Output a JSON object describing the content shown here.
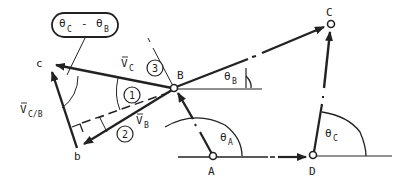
{
  "figure": {
    "type": "four-bar linkage velocity diagram",
    "colors": {
      "ink": "#222222",
      "background": "#ffffff"
    }
  },
  "points": {
    "A": "A",
    "B": "B",
    "C": "C",
    "D": "D",
    "b": "b",
    "c": "c"
  },
  "angles": {
    "theta_A": {
      "symbol": "θ",
      "sub": "A"
    },
    "theta_B": {
      "symbol": "θ",
      "sub": "B"
    },
    "theta_C": {
      "symbol": "θ",
      "sub": "C"
    },
    "difference_box": {
      "left_symbol": "θ",
      "left_sub": "C",
      "op": "-",
      "right_symbol": "θ",
      "right_sub": "B"
    }
  },
  "vectors": {
    "V_C": {
      "symbol": "V",
      "sub": "C"
    },
    "V_B": {
      "symbol": "V",
      "sub": "B"
    },
    "V_CB": {
      "symbol": "V",
      "sub": "C/B"
    }
  },
  "markers": [
    "1",
    "2",
    "3"
  ]
}
